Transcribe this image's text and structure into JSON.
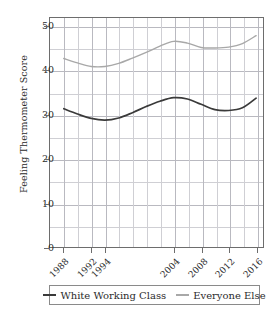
{
  "chart_data": {
    "type": "line",
    "title": "",
    "xlabel": "",
    "ylabel": "Feeling Thermometer Score",
    "ylim": [
      0,
      52
    ],
    "xlim": [
      1986,
      2017
    ],
    "yticks": [
      0,
      10,
      20,
      30,
      40,
      50
    ],
    "ytick_labels": [
      "0",
      "10",
      "20",
      "30",
      "40",
      "50"
    ],
    "xticks": [
      1988,
      1992,
      1994,
      2004,
      2008,
      2012,
      2016
    ],
    "xtick_labels": [
      "1988",
      "1992",
      "1994",
      "2004",
      "2008",
      "2012",
      "2016"
    ],
    "grid": true,
    "legend_position": "below",
    "series": [
      {
        "name": "White Working Class",
        "color": "#3a3a3a",
        "x": [
          1988,
          1990,
          1992,
          1994,
          1996,
          1998,
          2000,
          2002,
          2004,
          2006,
          2008,
          2010,
          2012,
          2014,
          2016
        ],
        "values": [
          31.4,
          30.2,
          29.2,
          28.8,
          29.3,
          30.5,
          31.9,
          33.1,
          33.9,
          33.6,
          32.4,
          31.2,
          31.0,
          31.6,
          33.8
        ]
      },
      {
        "name": "Everyone Else",
        "color": "#a8a8a8",
        "x": [
          1988,
          1990,
          1992,
          1994,
          1996,
          1998,
          2000,
          2002,
          2004,
          2006,
          2008,
          2010,
          2012,
          2014,
          2016
        ],
        "values": [
          42.8,
          41.8,
          41.0,
          41.0,
          41.7,
          42.9,
          44.2,
          45.6,
          46.7,
          46.3,
          45.3,
          45.2,
          45.4,
          46.2,
          48.0
        ]
      }
    ]
  },
  "legend": {
    "items": [
      {
        "label": "White Working Class",
        "color": "#3a3a3a"
      },
      {
        "label": "Everyone Else",
        "color": "#a8a8a8"
      }
    ]
  }
}
